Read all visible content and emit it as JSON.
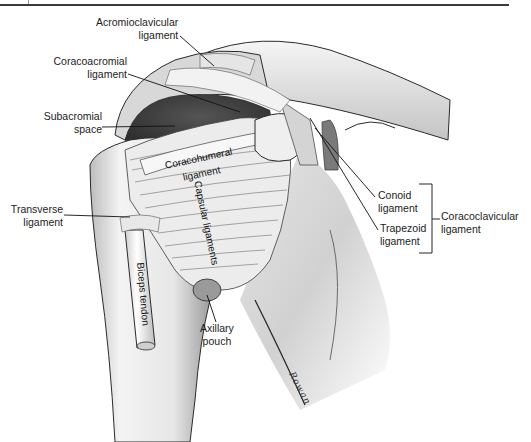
{
  "figure": {
    "artist_signature": "Rowan",
    "colors": {
      "ink": "#1c1c1c",
      "bone_shadow": "#5a5a5a",
      "subacromial_space": "#4a4a4a",
      "bone_light": "#f2f2f2",
      "rule": "#3a3a3a"
    }
  },
  "labels": {
    "acromioclavicular": {
      "line1": "Acromioclavicular",
      "line2": "ligament"
    },
    "coracoacromial": {
      "line1": "Coracoacromial",
      "line2": "ligament"
    },
    "subacromial": {
      "line1": "Subacromial",
      "line2": "space"
    },
    "transverse": {
      "line1": "Transverse",
      "line2": "ligament"
    },
    "conoid": {
      "line1": "Conoid",
      "line2": "ligament"
    },
    "trapezoid": {
      "line1": "Trapezoid",
      "line2": "ligament"
    },
    "coracoclavicular": {
      "line1": "Coracoclavicular",
      "line2": "ligament"
    },
    "axillary": {
      "line1": "Axillary",
      "line2": "pouch"
    }
  },
  "inline_labels": {
    "coracohumeral_1": "Coracohumeral",
    "coracohumeral_2": "ligament",
    "capsular": "Capsular ligaments",
    "biceps": "Biceps tendon"
  }
}
